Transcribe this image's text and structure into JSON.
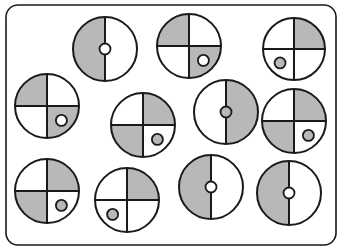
{
  "colors": {
    "stroke": "#1a1a1a",
    "fill": "#b8b8b8",
    "background": "#ffffff"
  },
  "frame": {
    "x": 6,
    "y": 5,
    "width": 330,
    "height": 240,
    "radius": 12
  },
  "circles": [
    {
      "id": "circle-1",
      "cx": 105,
      "cy": 49,
      "r": 32,
      "type": "halves",
      "left": "gray",
      "right": "white",
      "dot": {
        "pos": "center",
        "color": "white"
      }
    },
    {
      "id": "circle-2",
      "cx": 189,
      "cy": 46,
      "r": 32,
      "type": "quarters",
      "tl": "gray",
      "tr": "white",
      "bl": "white",
      "br": "gray",
      "dot": {
        "pos": "br",
        "color": "white"
      }
    },
    {
      "id": "circle-3",
      "cx": 294,
      "cy": 49,
      "r": 31,
      "type": "quarters",
      "tl": "white",
      "tr": "gray",
      "bl": "white",
      "br": "white",
      "dot": {
        "pos": "bl",
        "color": "gray"
      }
    },
    {
      "id": "circle-4",
      "cx": 47,
      "cy": 106,
      "r": 32,
      "type": "quarters",
      "tl": "gray",
      "tr": "white",
      "bl": "white",
      "br": "gray",
      "dot": {
        "pos": "br",
        "color": "white"
      }
    },
    {
      "id": "circle-5",
      "cx": 143,
      "cy": 125,
      "r": 32,
      "type": "quarters",
      "tl": "white",
      "tr": "gray",
      "bl": "gray",
      "br": "white",
      "dot": {
        "pos": "br",
        "color": "gray"
      }
    },
    {
      "id": "circle-6",
      "cx": 226,
      "cy": 112,
      "r": 32,
      "type": "halves",
      "left": "white",
      "right": "gray",
      "dot": {
        "pos": "center",
        "color": "gray"
      }
    },
    {
      "id": "circle-7",
      "cx": 294,
      "cy": 121,
      "r": 32,
      "type": "quarters",
      "tl": "white",
      "tr": "gray",
      "bl": "gray",
      "br": "white",
      "dot": {
        "pos": "br",
        "color": "gray"
      }
    },
    {
      "id": "circle-8",
      "cx": 47,
      "cy": 191,
      "r": 32,
      "type": "quarters",
      "tl": "white",
      "tr": "gray",
      "bl": "gray",
      "br": "white",
      "dot": {
        "pos": "br",
        "color": "gray"
      }
    },
    {
      "id": "circle-9",
      "cx": 127,
      "cy": 200,
      "r": 32,
      "type": "quarters",
      "tl": "white",
      "tr": "gray",
      "bl": "white",
      "br": "white",
      "dot": {
        "pos": "bl",
        "color": "gray"
      }
    },
    {
      "id": "circle-10",
      "cx": 211,
      "cy": 187,
      "r": 32,
      "type": "halves",
      "left": "gray",
      "right": "white",
      "dot": {
        "pos": "center",
        "color": "white"
      }
    },
    {
      "id": "circle-11",
      "cx": 289,
      "cy": 193,
      "r": 32,
      "type": "halves",
      "left": "gray",
      "right": "white",
      "dot": {
        "pos": "center",
        "color": "white"
      }
    }
  ]
}
